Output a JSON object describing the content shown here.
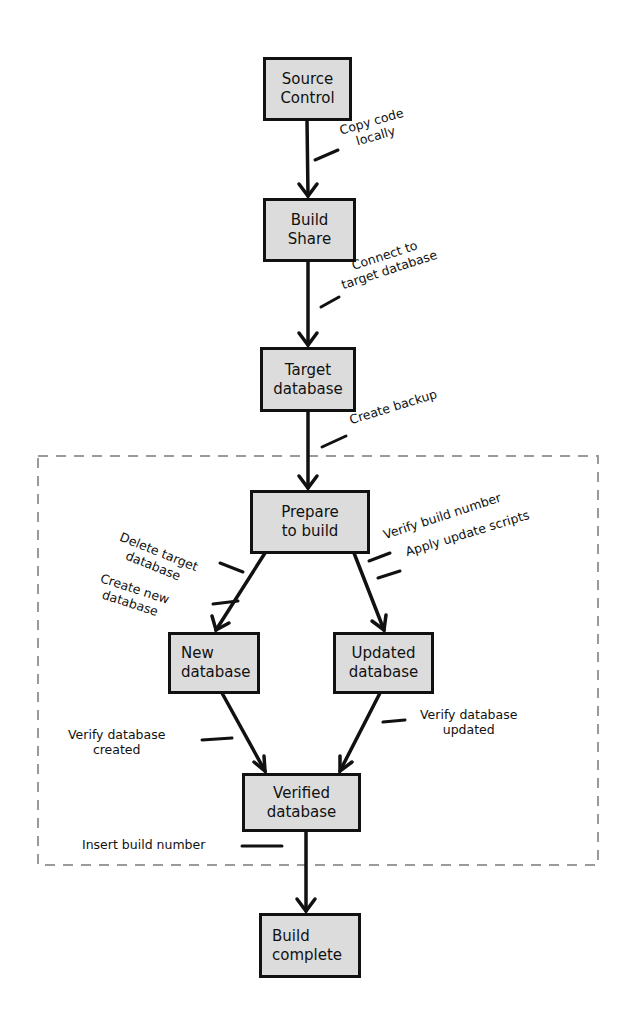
{
  "diagram": {
    "type": "flowchart",
    "nodes": [
      {
        "id": "source-control",
        "lines": [
          "Source",
          "Control"
        ]
      },
      {
        "id": "build-share",
        "lines": [
          "Build",
          "Share"
        ]
      },
      {
        "id": "target-database",
        "lines": [
          "Target",
          "database"
        ]
      },
      {
        "id": "prepare-to-build",
        "lines": [
          "Prepare",
          "to build"
        ]
      },
      {
        "id": "new-database",
        "lines": [
          "New",
          "database"
        ]
      },
      {
        "id": "updated-database",
        "lines": [
          "Updated",
          "database"
        ]
      },
      {
        "id": "verified-database",
        "lines": [
          "Verified",
          "database"
        ]
      },
      {
        "id": "build-complete",
        "lines": [
          "Build",
          "complete"
        ]
      }
    ],
    "edges": [
      {
        "from": "source-control",
        "to": "build-share",
        "annotation": [
          "Copy code",
          "locally"
        ]
      },
      {
        "from": "build-share",
        "to": "target-database",
        "annotation": [
          "Connect to",
          "target database"
        ]
      },
      {
        "from": "target-database",
        "to": "prepare-to-build",
        "annotation": [
          "Create backup"
        ]
      },
      {
        "from": "prepare-to-build",
        "to": "new-database",
        "annotation": [
          "Delete target database",
          "Create new database"
        ]
      },
      {
        "from": "prepare-to-build",
        "to": "updated-database",
        "annotation": [
          "Verify build number",
          "Apply update scripts"
        ]
      },
      {
        "from": "new-database",
        "to": "verified-database",
        "annotation": [
          "Verify database",
          "created"
        ]
      },
      {
        "from": "updated-database",
        "to": "verified-database",
        "annotation": [
          "Verify database",
          "updated"
        ]
      },
      {
        "from": "verified-database",
        "to": "build-complete",
        "annotation": [
          "Insert build number"
        ]
      }
    ],
    "group": {
      "style": "dashed",
      "contains": [
        "prepare-to-build",
        "new-database",
        "updated-database",
        "verified-database"
      ]
    }
  },
  "notes": {
    "copy_code": [
      "Copy code",
      "locally"
    ],
    "connect": [
      "Connect to",
      "target database"
    ],
    "create_backup": "Create backup",
    "delete_target": [
      "Delete target",
      "database"
    ],
    "create_new": [
      "Create new",
      "database"
    ],
    "verify_build_number": "Verify build number",
    "apply_update": "Apply update scripts",
    "verify_created": [
      "Verify database",
      "created"
    ],
    "verify_updated": [
      "Verify database",
      "updated"
    ],
    "insert_build_number": "Insert build number"
  },
  "colors": {
    "box_fill": "#dcdcdc",
    "stroke": "#111111",
    "dashed_border": "#9a9a9a",
    "background": "#ffffff"
  }
}
